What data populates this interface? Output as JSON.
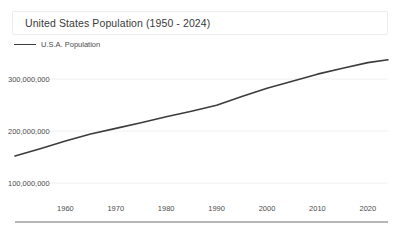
{
  "chart_data": {
    "type": "line",
    "title": "United States Population (1950 - 2024)",
    "xlabel": "",
    "ylabel": "",
    "grid": true,
    "legend_position": "top-left",
    "xlim": [
      1950,
      2024
    ],
    "ylim": [
      0,
      350000000
    ],
    "xticks": [
      1960,
      1970,
      1980,
      1990,
      2000,
      2010,
      2020
    ],
    "xticklabels": [
      "1960",
      "1970",
      "1980",
      "1990",
      "2000",
      "2010",
      "2020"
    ],
    "yticks": [
      100000000,
      200000000,
      300000000
    ],
    "yticklabels": [
      "100,000,000",
      "200,000,000",
      "300,000,000"
    ],
    "series": [
      {
        "name": "U.S.A. Population",
        "color": "#3c3c3c",
        "x": [
          1950,
          1955,
          1960,
          1965,
          1970,
          1975,
          1980,
          1985,
          1990,
          1995,
          2000,
          2005,
          2010,
          2015,
          2020,
          2024
        ],
        "values": [
          151868000,
          165931000,
          180671000,
          194303000,
          205052000,
          215973000,
          227225000,
          237924000,
          249623000,
          266278000,
          282162000,
          295517000,
          309327000,
          320739000,
          331449000,
          337000000
        ]
      }
    ]
  },
  "legend": {
    "entries": [
      {
        "label": "U.S.A. Population",
        "color": "#3c3c3c",
        "swatch": "line-swatch-icon"
      }
    ]
  },
  "axis": {
    "x_line_color": "#6f6f6f",
    "grid_color": "#f0f0f0"
  }
}
